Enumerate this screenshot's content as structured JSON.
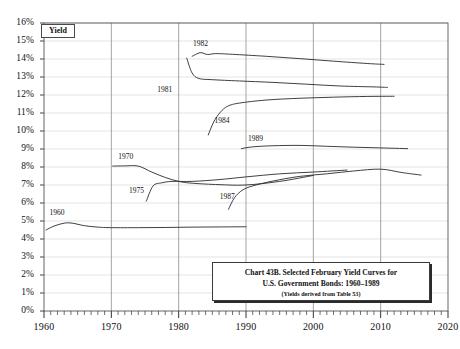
{
  "yield_axis_box_label": "Yield",
  "title_box": {
    "line1": "Chart 43B. Selected February Yield Curves for",
    "line2": "U.S. Government Bonds: 1960–1989",
    "note": "(Yields derived from Table 53)"
  },
  "chart_data": {
    "type": "line",
    "subtitle": "(Yields derived from Table 53)",
    "xlabel": "",
    "ylabel": "Yield",
    "xlim": [
      1960,
      2020
    ],
    "ylim": [
      0,
      16
    ],
    "xticks": [
      1960,
      1970,
      1980,
      1990,
      2000,
      2010,
      2020
    ],
    "xtick_labels": [
      "1960",
      "1970",
      "1980",
      "1990",
      "2000",
      "2010",
      "2020"
    ],
    "minor_xtick_interval": 1,
    "yticks": [
      0,
      1,
      2,
      3,
      4,
      5,
      6,
      7,
      8,
      9,
      10,
      11,
      12,
      13,
      14,
      15,
      16
    ],
    "ytick_labels": [
      "0%",
      "1%",
      "2%",
      "3%",
      "4%",
      "5%",
      "6%",
      "7%",
      "8%",
      "9%",
      "10%",
      "11%",
      "12%",
      "13%",
      "14%",
      "15%",
      "16%"
    ],
    "grid": "horizontal-light-and-decade-verticals",
    "legend": "inline-series-labels",
    "series": [
      {
        "name": "1960",
        "label": "1960",
        "label_x": 1962.0,
        "label_y": 5.45,
        "x": [
          1960.3,
          1961.5,
          1963.0,
          1964.2,
          1966.0,
          1968.0,
          1970.0,
          1974.0,
          1978.0,
          1982.0,
          1986.0,
          1990.0
        ],
        "y": [
          4.5,
          4.72,
          4.88,
          4.88,
          4.74,
          4.66,
          4.63,
          4.63,
          4.64,
          4.66,
          4.67,
          4.68
        ]
      },
      {
        "name": "1970",
        "label": "1970",
        "label_x": 1972.2,
        "label_y": 8.55,
        "x": [
          1970.2,
          1972.0,
          1974.0,
          1976.0,
          1978.0,
          1980.0,
          1982.0,
          1986.0,
          1990.0,
          1995.0,
          2000.0
        ],
        "y": [
          8.05,
          8.06,
          8.05,
          7.72,
          7.42,
          7.2,
          7.1,
          7.02,
          7.0,
          7.2,
          7.53
        ]
      },
      {
        "name": "1975",
        "label": "1975",
        "label_x": 1973.8,
        "label_y": 6.65,
        "x": [
          1975.2,
          1976.2,
          1977.5,
          1979.0,
          1982.0,
          1986.0,
          1990.0,
          1995.0,
          2000.0,
          2005.0
        ],
        "y": [
          6.1,
          6.95,
          7.12,
          7.2,
          7.2,
          7.3,
          7.45,
          7.62,
          7.72,
          7.83
        ]
      },
      {
        "name": "1981",
        "label": "1981",
        "label_x": 1978.0,
        "label_y": 12.3,
        "x": [
          1981.2,
          1982.0,
          1983.0,
          1985.0,
          1989.0,
          1994.0,
          1999.0,
          2004.0,
          2009.0,
          2011.0
        ],
        "y": [
          14.05,
          13.22,
          12.92,
          12.85,
          12.78,
          12.7,
          12.6,
          12.5,
          12.45,
          12.42
        ]
      },
      {
        "name": "1982",
        "label": "1982",
        "label_x": 1983.3,
        "label_y": 14.85,
        "x": [
          1982.0,
          1983.2,
          1984.3,
          1985.5,
          1988.0,
          1993.0,
          1998.0,
          2003.0,
          2008.0,
          2010.5
        ],
        "y": [
          14.15,
          14.35,
          14.25,
          14.3,
          14.26,
          14.15,
          14.02,
          13.88,
          13.75,
          13.7
        ]
      },
      {
        "name": "1984",
        "label": "1984",
        "label_x": 1986.5,
        "label_y": 10.55,
        "x": [
          1984.4,
          1985.2,
          1986.2,
          1987.3,
          1989.0,
          1993.0,
          1998.0,
          2003.0,
          2008.0,
          2012.0
        ],
        "y": [
          9.78,
          10.5,
          11.05,
          11.38,
          11.55,
          11.72,
          11.82,
          11.88,
          11.92,
          11.93
        ]
      },
      {
        "name": "1989",
        "label": "1989",
        "label_x": 1991.5,
        "label_y": 9.55,
        "x": [
          1989.3,
          1991.0,
          1994.0,
          1998.0,
          2002.0,
          2006.0,
          2010.0,
          2014.0
        ],
        "y": [
          9.02,
          9.12,
          9.18,
          9.2,
          9.15,
          9.1,
          9.06,
          9.02
        ]
      },
      {
        "name": "1987",
        "label": "1987",
        "label_x": 1987.3,
        "label_y": 6.35,
        "x": [
          1987.4,
          1988.3,
          1989.5,
          1991.0,
          1994.0,
          1998.0,
          2002.0,
          2006.0,
          2010.0,
          2013.0,
          2016.0
        ],
        "y": [
          5.65,
          6.3,
          6.72,
          6.95,
          7.22,
          7.48,
          7.62,
          7.78,
          7.88,
          7.7,
          7.55
        ]
      }
    ]
  }
}
